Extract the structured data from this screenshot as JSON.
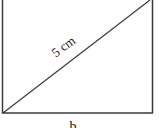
{
  "diagram": {
    "shape": "rectangle",
    "diagonal_label": "5 cm",
    "bottom_label": "b",
    "stroke_color": "#333333",
    "background": "#ffffff"
  }
}
